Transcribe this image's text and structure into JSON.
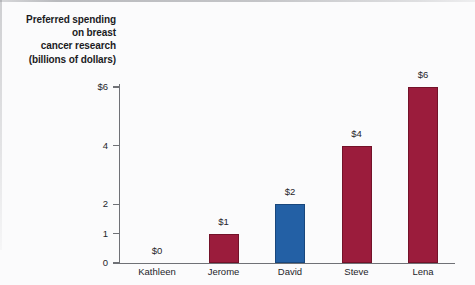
{
  "chart_data": {
    "type": "bar",
    "title": "Preferred spending on breast cancer research (billions of dollars)",
    "title_lines": [
      "Preferred spending",
      "on breast",
      "cancer research",
      "(billions of dollars)"
    ],
    "xlabel": "",
    "ylabel": "Preferred spending on breast cancer research (billions of dollars)",
    "categories": [
      "Kathleen",
      "Jerome",
      "David",
      "Steve",
      "Lena"
    ],
    "values": [
      0,
      1,
      2,
      4,
      6
    ],
    "value_labels": [
      "$0",
      "$1",
      "$2",
      "$4",
      "$6"
    ],
    "bar_colors": [
      "#9b1c3c",
      "#9b1c3c",
      "#2360a5",
      "#9b1c3c",
      "#9b1c3c"
    ],
    "highlighted_category": "David",
    "ylim": [
      0,
      6
    ],
    "y_ticks": [
      0,
      1,
      2,
      4,
      6
    ],
    "y_tick_labels": [
      "0",
      "1",
      "2",
      "4",
      "$6"
    ],
    "grid": false,
    "legend": false
  },
  "colors": {
    "crimson": "#9b1c3c",
    "crimson_edge": "#731229",
    "blue": "#2360a5",
    "blue_edge": "#19477c",
    "axis": "#6f7176",
    "text": "#25252a",
    "background": "#fbfbfc"
  }
}
